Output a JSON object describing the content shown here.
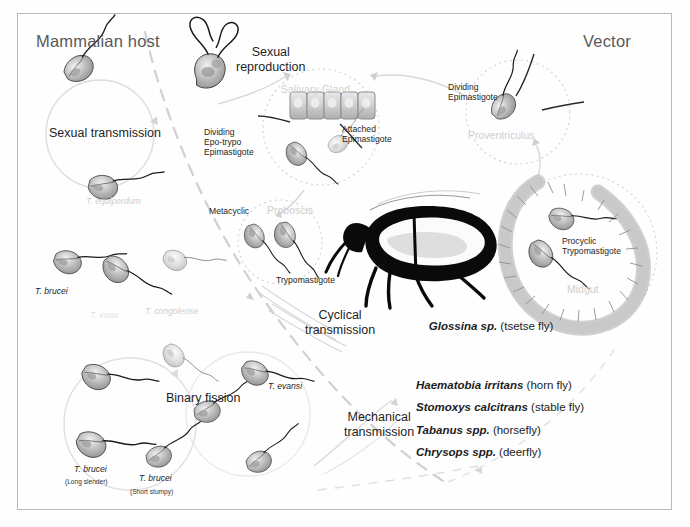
{
  "figure": {
    "titles": {
      "host": "Mammalian host",
      "vector": "Vector"
    },
    "host_side": {
      "sexual_transmission": "Sexual transmission",
      "t_equiperdum": "T. equiperdum",
      "t_brucei": "T. brucei",
      "t_vivax": "T. vivax",
      "t_congolense": "T. congolense",
      "binary_fission": "Binary fission",
      "t_brucei_long": "T. brucei",
      "t_brucei_long_sub": "(Long slender)",
      "t_brucei_short": "T. brucei",
      "t_brucei_short_sub": "(Short stumpy)",
      "t_evansi": "T. evansi"
    },
    "vector_side": {
      "sexual_reproduction": "Sexual\nreproduction",
      "salivary_gland": "Salivary Gland",
      "dividing_epo_trypo": "Dividing\nEpo-trypo\nEpimastigote",
      "attached_epimastigote": "Attached\nEpimastigote",
      "metacyclic": "Metacyclic",
      "proboscis": "Proboscis",
      "trypomastigote": "Trypomastigote",
      "dividing_epimastigote": "Dividing\nEpimastigote",
      "proventriculus": "Proventriculus",
      "procyclic_trypomastigote": "Procyclic\nTrypomastigote",
      "midgut": "Midgut"
    },
    "transmission": {
      "cyclical": "Cyclical\ntransmission",
      "mechanical": "Mechanical\ntransmission"
    },
    "vectors": {
      "tsetse_species": "Glossina sp.",
      "tsetse_common": " (tsetse fly)",
      "mechanical_list": [
        {
          "species": "Haematobia irritans",
          "common": " (horn fly)"
        },
        {
          "species": "Stomoxys calcitrans",
          "common": " (stable fly)"
        },
        {
          "species": "Tabanus spp.",
          "common": " (horsefly)"
        },
        {
          "species": "Chrysops spp.",
          "common": " (deerfly)"
        }
      ]
    },
    "colors": {
      "frame": "#b9b9b9",
      "title_gray": "#595959",
      "text_dark": "#1c1c1c",
      "ghost_gray": "#cfcfcf",
      "ghost_light": "#e2e2e2",
      "fly_black": "#000000",
      "cell_fill": "#d9d9d9"
    }
  }
}
